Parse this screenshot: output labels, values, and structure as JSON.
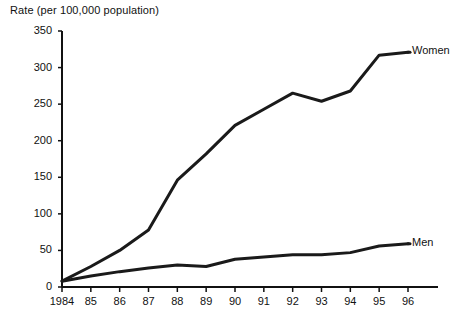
{
  "chart_data": {
    "type": "line",
    "title": "Rate (per 100,000 population)",
    "xlabel": "",
    "ylabel": "Rate (per 100,000 population)",
    "categories": [
      "1984",
      "85",
      "86",
      "87",
      "88",
      "89",
      "90",
      "91",
      "92",
      "93",
      "94",
      "95",
      "96"
    ],
    "x": [
      1984,
      1985,
      1986,
      1987,
      1988,
      1989,
      1990,
      1991,
      1992,
      1993,
      1994,
      1995,
      1996
    ],
    "series": [
      {
        "name": "Women",
        "values": [
          8,
          28,
          50,
          78,
          146,
          182,
          221,
          243,
          265,
          254,
          268,
          317,
          321
        ]
      },
      {
        "name": "Men",
        "values": [
          8,
          15,
          21,
          26,
          30,
          28,
          38,
          41,
          44,
          44,
          47,
          56,
          59
        ]
      }
    ],
    "ylim": [
      0,
      350
    ],
    "yticks": [
      0,
      50,
      100,
      150,
      200,
      250,
      300,
      350
    ],
    "ytick_labels": [
      "0",
      "50",
      "100",
      "150",
      "200",
      "250",
      "300",
      "350"
    ],
    "grid": false,
    "legend_position": "inline-right",
    "line_color": "#1a1a1a"
  },
  "labels": {
    "women": "Women",
    "men": "Men"
  }
}
